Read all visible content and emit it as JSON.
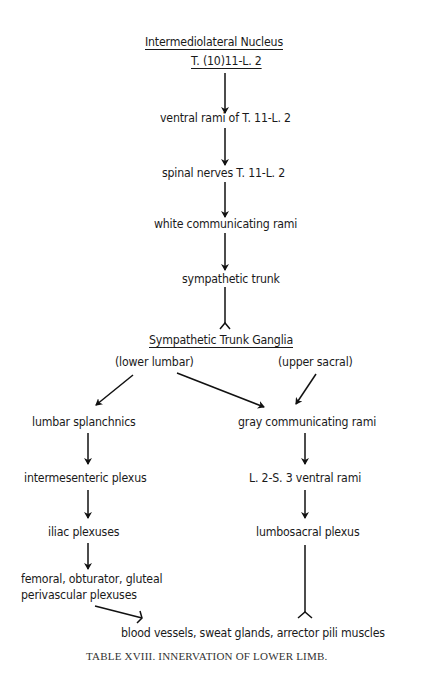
{
  "diagram": {
    "title": "Intermediolateral Nucleus",
    "subtitle": "T. (10)11-L. 2",
    "chain": [
      "ventral rami of T. 11-L. 2",
      "spinal nerves T. 11-L. 2",
      "white communicating rami",
      "sympathetic trunk"
    ],
    "ganglia": "Sympathetic Trunk Ganglia",
    "branch_left_label": "(lower lumbar)",
    "branch_right_label": "(upper sacral)",
    "left_column": [
      "lumbar splanchnics",
      "intermesenteric plexus",
      "iliac plexuses",
      "femoral, obturator, gluteal",
      "perivascular plexuses"
    ],
    "right_column": [
      "gray communicating rami",
      "L. 2-S. 3 ventral rami",
      "lumbosacral plexus"
    ],
    "target": "blood vessels, sweat glands, arrector pili muscles"
  },
  "caption": "TABLE XVIII. INNERVATION OF LOWER LIMB."
}
